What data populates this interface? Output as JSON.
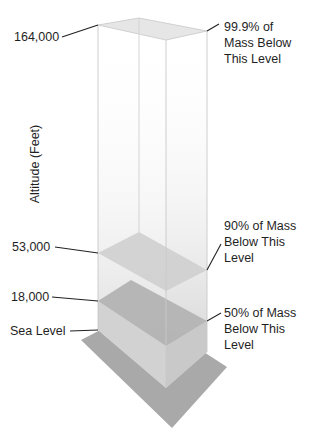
{
  "diagram": {
    "axis_title": "Altitude (Feet)",
    "levels": [
      {
        "altitude": "164,000",
        "annotation": "99.9% of\nMass Below\nThis Level"
      },
      {
        "altitude": "53,000",
        "annotation": "90% of Mass\nBelow This\nLevel"
      },
      {
        "altitude": "18,000",
        "annotation": "50% of Mass\nBelow This\nLevel"
      },
      {
        "altitude": "Sea Level",
        "annotation": ""
      }
    ]
  },
  "colors": {
    "ground": "#a9a9a9",
    "plane_18000": "#b3b3b3",
    "plane_53000": "#cfcfcf",
    "plane_164000": "#e6e6e6",
    "column_edge": "#c8c8c8",
    "leader_line": "#222222"
  }
}
